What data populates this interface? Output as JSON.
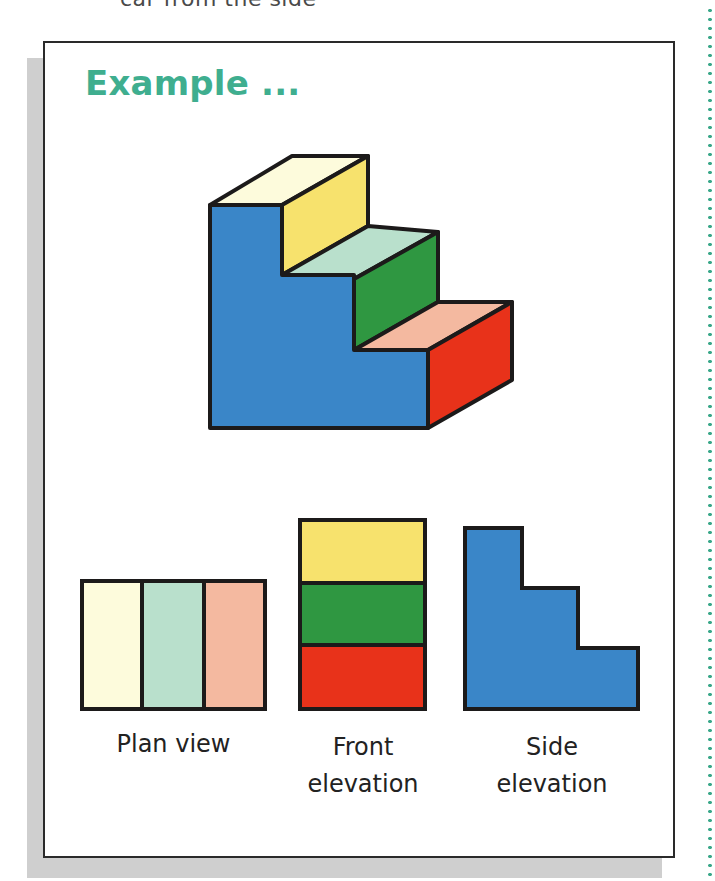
{
  "page": {
    "top_caption": "car from the side"
  },
  "card": {
    "title": "Example ..."
  },
  "colors": {
    "title_teal": "#3fae8f",
    "outline": "#1c1a1a",
    "blue_side": "#3a86c8",
    "yellow_riser": "#f7e26d",
    "green_riser": "#2f9741",
    "red_riser": "#e8321a",
    "tread_top_cream": "#fdfbdc",
    "tread_mid_mint": "#b9e0cc",
    "tread_low_salmon": "#f4b9a0",
    "shadow_grey": "#cfcfcf",
    "dotted_rule_teal": "#3aa88a"
  },
  "figure": {
    "object": "three-step staircase (isometric view)",
    "views": [
      {
        "id": "plan",
        "label": "Plan view",
        "strips": [
          "tread_top_cream",
          "tread_mid_mint",
          "tread_low_salmon"
        ]
      },
      {
        "id": "front",
        "label": "Front\nelevation",
        "bands": [
          "yellow_riser",
          "green_riser",
          "red_riser"
        ]
      },
      {
        "id": "side",
        "label": "Side\nelevation",
        "shape": "L-shaped stepped profile"
      }
    ]
  }
}
